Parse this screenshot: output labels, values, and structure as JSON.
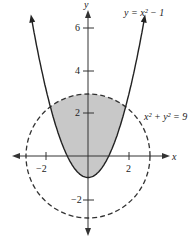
{
  "figure": {
    "curves": [
      {
        "name": "parabola",
        "equation": "y = x² − 1",
        "style": "solid"
      },
      {
        "name": "circle",
        "equation": "x² + y² = 9",
        "style": "dashed"
      }
    ],
    "shaded_region": "inside circle and above parabola",
    "axes": {
      "x_label": "x",
      "y_label": "y",
      "x_ticks": [
        "−2",
        "2"
      ],
      "y_ticks": [
        "6",
        "4",
        "2",
        "−2"
      ]
    },
    "colors": {
      "shade": "#c8c8c8",
      "line": "#222222"
    }
  },
  "chart_data": {
    "type": "line",
    "title": "",
    "xlabel": "x",
    "ylabel": "y",
    "series": [
      {
        "name": "y = x² − 1",
        "style": "solid",
        "x": [
          -2.75,
          -2,
          -1,
          0,
          1,
          2,
          2.75
        ],
        "y": [
          6.56,
          3,
          0,
          -1,
          0,
          3,
          6.56
        ]
      },
      {
        "name": "x² + y² = 9",
        "style": "dashed",
        "shape": "circle",
        "center": [
          0,
          0
        ],
        "radius": 3
      }
    ],
    "shaded": "region inside x²+y²=9 above y=x²−1",
    "x_ticks": [
      -2,
      2
    ],
    "y_ticks": [
      6,
      4,
      2,
      -2
    ],
    "xlim": [
      -4,
      4
    ],
    "ylim": [
      -3.5,
      7
    ]
  }
}
